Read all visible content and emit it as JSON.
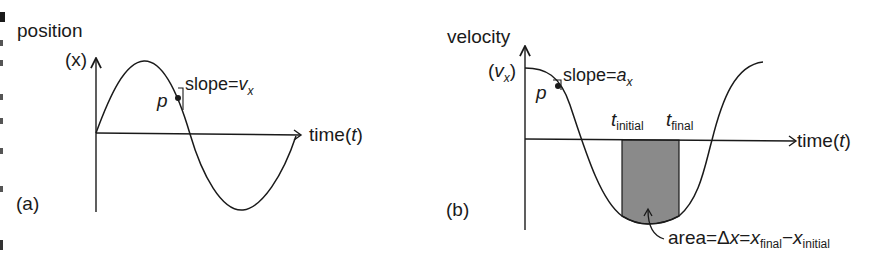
{
  "panel_a": {
    "label": "(a)",
    "y_axis_label": "position",
    "y_axis_symbol": "(x)",
    "x_axis_label": "time(",
    "x_axis_var": "t",
    "x_axis_close": ")",
    "point_label": "p",
    "slope_text": "slope=",
    "slope_var": "v",
    "slope_sub": "x",
    "curve": "position vs time sine curve"
  },
  "panel_b": {
    "label": "(b)",
    "y_axis_label": "velocity",
    "y_axis_open": "(",
    "y_axis_var": "v",
    "y_axis_sub": "x",
    "y_axis_close": ")",
    "x_axis_label": "time(",
    "x_axis_var": "t",
    "x_axis_close": ")",
    "point_label": "p",
    "slope_text": "slope=",
    "slope_var": "a",
    "slope_sub": "x",
    "t_initial_var": "t",
    "t_initial_sub": "initial",
    "t_final_var": "t",
    "t_final_sub": "final",
    "area_text": "area=Δ",
    "area_x1": "x",
    "area_eq": "=",
    "area_x2": "x",
    "area_sub_final": "final",
    "area_minus": "−",
    "area_x3": "x",
    "area_sub_initial": "initial",
    "shade_color": "#8a8a8a"
  },
  "colors": {
    "ink": "#1a1a1a",
    "shade": "#8a8a8a",
    "background": "#ffffff"
  }
}
